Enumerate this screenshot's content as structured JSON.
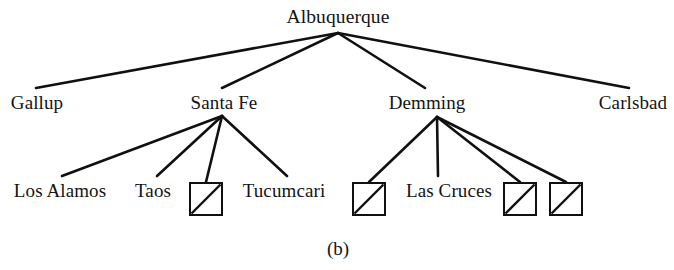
{
  "figure": {
    "caption": "(b)",
    "caption_x": 338,
    "caption_y": 248,
    "width": 674,
    "height": 270,
    "background_color": "#ffffff",
    "line_color": "#101010",
    "text_color": "#141414"
  },
  "chart_data": {
    "type": "diagram",
    "subtype": "tree",
    "title": "(b)",
    "root": "Albuquerque",
    "nodes": [
      {
        "id": "albuquerque",
        "label": "Albuquerque",
        "level": 0,
        "x": 338,
        "y": 16,
        "anchor_x": 338,
        "anchor_y": 33
      },
      {
        "id": "gallup",
        "label": "Gallup",
        "level": 1,
        "x": 37,
        "y": 102,
        "anchor_x": 36,
        "anchor_y": 88
      },
      {
        "id": "santafe",
        "label": "Santa Fe",
        "level": 1,
        "x": 224,
        "y": 102,
        "anchor_x": 222,
        "anchor_y": 88,
        "apex_x": 222,
        "apex_y": 116
      },
      {
        "id": "demming",
        "label": "Demming",
        "level": 1,
        "x": 427,
        "y": 102,
        "anchor_x": 425,
        "anchor_y": 88,
        "apex_x": 437,
        "apex_y": 117
      },
      {
        "id": "carlsbad",
        "label": "Carlsbad",
        "level": 1,
        "x": 633,
        "y": 102,
        "anchor_x": 629,
        "anchor_y": 88
      },
      {
        "id": "losalamos",
        "label": "Los Alamos",
        "level": 2,
        "parent": "santafe",
        "x": 60,
        "y": 190,
        "anchor_x": 62,
        "anchor_y": 176
      },
      {
        "id": "taos",
        "label": "Taos",
        "level": 2,
        "parent": "santafe",
        "x": 153,
        "y": 190,
        "anchor_x": 157,
        "anchor_y": 176
      },
      {
        "id": "box1",
        "label": "",
        "level": 2,
        "parent": "santafe",
        "is_box": true,
        "box_x": 189,
        "box_y": 182,
        "box_size": 34,
        "anchor_x": 206,
        "anchor_y": 182
      },
      {
        "id": "tucumcari",
        "label": "Tucumcari",
        "level": 2,
        "parent": "santafe",
        "x": 284,
        "y": 190,
        "anchor_x": 287,
        "anchor_y": 176
      },
      {
        "id": "box2",
        "label": "",
        "level": 2,
        "parent": "demming",
        "is_box": true,
        "box_x": 352,
        "box_y": 182,
        "box_size": 34,
        "anchor_x": 369,
        "anchor_y": 182
      },
      {
        "id": "lascruces",
        "label": "Las Cruces",
        "level": 2,
        "parent": "demming",
        "x": 449,
        "y": 190,
        "anchor_x": 438,
        "anchor_y": 176
      },
      {
        "id": "box3",
        "label": "",
        "level": 2,
        "parent": "demming",
        "is_box": true,
        "box_x": 503,
        "box_y": 182,
        "box_size": 34,
        "anchor_x": 520,
        "anchor_y": 182
      },
      {
        "id": "box4",
        "label": "",
        "level": 2,
        "parent": "demming",
        "is_box": true,
        "box_x": 549,
        "box_y": 182,
        "box_size": 34,
        "anchor_x": 566,
        "anchor_y": 182
      }
    ],
    "edges": [
      {
        "from": "albuquerque",
        "to": "gallup",
        "x1": 338,
        "y1": 33,
        "x2": 36,
        "y2": 88
      },
      {
        "from": "albuquerque",
        "to": "santafe",
        "x1": 338,
        "y1": 33,
        "x2": 222,
        "y2": 88
      },
      {
        "from": "albuquerque",
        "to": "demming",
        "x1": 338,
        "y1": 33,
        "x2": 425,
        "y2": 88
      },
      {
        "from": "albuquerque",
        "to": "carlsbad",
        "x1": 338,
        "y1": 33,
        "x2": 629,
        "y2": 88
      },
      {
        "from": "santafe",
        "to": "losalamos",
        "x1": 222,
        "y1": 116,
        "x2": 62,
        "y2": 176
      },
      {
        "from": "santafe",
        "to": "taos",
        "x1": 222,
        "y1": 116,
        "x2": 157,
        "y2": 176
      },
      {
        "from": "santafe",
        "to": "box1",
        "x1": 222,
        "y1": 116,
        "x2": 206,
        "y2": 182
      },
      {
        "from": "santafe",
        "to": "tucumcari",
        "x1": 222,
        "y1": 116,
        "x2": 287,
        "y2": 176
      },
      {
        "from": "demming",
        "to": "box2",
        "x1": 437,
        "y1": 117,
        "x2": 369,
        "y2": 182
      },
      {
        "from": "demming",
        "to": "lascruces",
        "x1": 437,
        "y1": 117,
        "x2": 438,
        "y2": 176
      },
      {
        "from": "demming",
        "to": "box3",
        "x1": 437,
        "y1": 117,
        "x2": 520,
        "y2": 182
      },
      {
        "from": "demming",
        "to": "box4",
        "x1": 437,
        "y1": 117,
        "x2": 566,
        "y2": 182
      }
    ],
    "box_diagonal": "bottom-left-to-top-right",
    "labels": [
      "Albuquerque",
      "Gallup",
      "Santa Fe",
      "Demming",
      "Carlsbad",
      "Los Alamos",
      "Taos",
      "Tucumcari",
      "Las Cruces"
    ]
  }
}
